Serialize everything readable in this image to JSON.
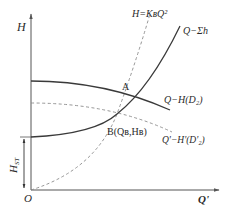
{
  "diagram": {
    "type": "pump-system-characteristic",
    "axes": {
      "y_label": "H",
      "x_label": "Q'",
      "origin_label": "O"
    },
    "curves": {
      "system_curve": {
        "label": "Q−Σh",
        "style": "solid"
      },
      "pump_curve": {
        "label": "Q−H(D₂)",
        "style": "solid"
      },
      "trimmed_pump_curve": {
        "label": "Q'−H'(D'₂)",
        "style": "dashed"
      },
      "similarity_parabola": {
        "label": "H=KʙQ²",
        "style": "dashed"
      }
    },
    "points": {
      "A": {
        "label": "A"
      },
      "B": {
        "label": "B(Qʙ,Hʙ)"
      }
    },
    "dimension": {
      "static_head_label": "H",
      "static_head_sub": "ST"
    },
    "colors": {
      "line": "#3a3a3a",
      "dashed": "#8a8a8a",
      "axis": "#555555",
      "background": "#ffffff"
    }
  }
}
